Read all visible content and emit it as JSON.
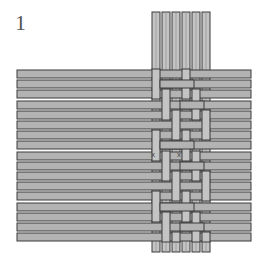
{
  "figure": {
    "label": "1"
  },
  "colors": {
    "strip_fill": "#b3b3b3",
    "strip_highlight": "#c4c4c4",
    "strip_edge": "#3a3a3a",
    "background": "#ffffff",
    "label": "#555555"
  },
  "horizontal_strips": {
    "count": 17,
    "x_start": 17,
    "x_end": 251,
    "y_start": 70,
    "pitch": 10.2,
    "height": 8
  },
  "vertical_strips": {
    "count": 6,
    "x_positions": [
      152,
      162,
      172,
      182,
      192,
      202
    ],
    "y_start": 12,
    "y_end": 252,
    "width": 8
  },
  "markers": [
    {
      "symbol": "x",
      "x": 151,
      "y": 157
    },
    {
      "symbol": "x",
      "x": 177,
      "y": 157
    }
  ]
}
